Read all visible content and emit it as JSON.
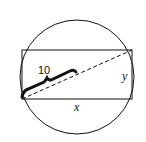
{
  "diagram": {
    "type": "rectangle inscribed in circle",
    "labels": {
      "diagonal_segment": "10",
      "width": "x",
      "height": "y"
    },
    "colors": {
      "stroke": "#111111",
      "background": "#ffffff"
    }
  }
}
